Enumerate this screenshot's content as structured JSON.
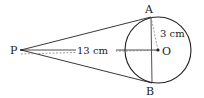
{
  "diagram": {
    "points": {
      "P": {
        "label": "P",
        "x": 21,
        "y": 50
      },
      "O": {
        "label": "O",
        "x": 158,
        "y": 50
      },
      "A": {
        "label": "A",
        "x": 151,
        "y": 17
      },
      "B": {
        "label": "B",
        "x": 152,
        "y": 83
      }
    },
    "circle": {
      "cx": 158,
      "cy": 50,
      "r": 33
    },
    "measurements": {
      "PO": "13 cm",
      "OA": "3 cm"
    },
    "colors": {
      "stroke": "#222222",
      "dashed": "#666666",
      "background": "#ffffff"
    }
  }
}
